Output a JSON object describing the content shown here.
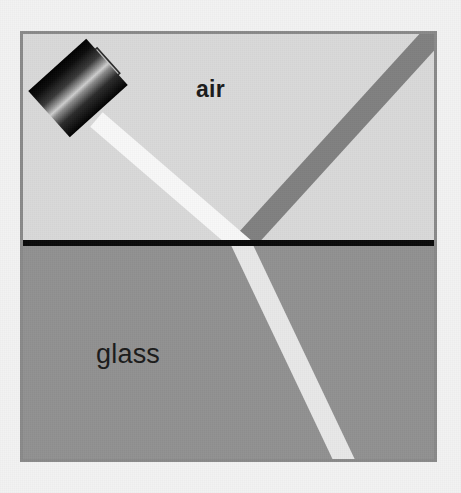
{
  "figure": {
    "type": "physics-optics-diagram",
    "canvas": {
      "width": 461,
      "height": 493
    },
    "background_color": "#f2f2f2"
  },
  "frame": {
    "name": "diagram-border",
    "x": 20,
    "y": 31,
    "width": 417,
    "height": 431,
    "stroke_color": "#8a8a8a",
    "stroke_width": 3
  },
  "media": {
    "upper": {
      "label": "air",
      "fill_color": "#d9d9d9",
      "region": {
        "x": 20,
        "y": 31,
        "width": 417,
        "height": 212
      },
      "label_position": {
        "x": 196,
        "y": 78
      },
      "label_weight": "bold",
      "label_size_px": 23
    },
    "lower": {
      "label": "glass",
      "fill_color": "#919191",
      "region": {
        "x": 20,
        "y": 246,
        "width": 417,
        "height": 216
      },
      "label_position": {
        "x": 96,
        "y": 341
      },
      "label_weight": "normal",
      "label_size_px": 27
    }
  },
  "interface": {
    "name": "air-glass-boundary",
    "color": "#0a0a0a",
    "y": 243,
    "x_start": 20,
    "x_end": 437,
    "thickness": 6
  },
  "source": {
    "name": "laser-pointer",
    "body_fill_dark": "#0d0d0d",
    "body_fill_highlight": "#c9c9c9",
    "center": {
      "x": 78,
      "y": 88
    },
    "length": 78,
    "width": 62,
    "rotation_deg": -42,
    "emitter_color": "#dcdcdc",
    "emitter_position": {
      "x": 103,
      "y": 122
    }
  },
  "rays": {
    "incident": {
      "name": "incident-ray",
      "color": "#f8f8f8",
      "from": {
        "x": 104,
        "y": 126
      },
      "to": {
        "x": 242,
        "y": 245
      },
      "width": 19,
      "angle_from_normal_deg": 49
    },
    "reflected": {
      "name": "reflected-ray",
      "color": "#808080",
      "from": {
        "x": 242,
        "y": 245
      },
      "to": {
        "x": 437,
        "y": 31
      },
      "width": 22,
      "angle_from_normal_deg": 42
    },
    "refracted": {
      "name": "refracted-ray",
      "color": "#e8e8e8",
      "from": {
        "x": 242,
        "y": 245
      },
      "to": {
        "x": 345,
        "y": 462
      },
      "width": 20,
      "angle_from_normal_deg": 25
    }
  },
  "intersection_point": {
    "x": 242,
    "y": 245
  }
}
